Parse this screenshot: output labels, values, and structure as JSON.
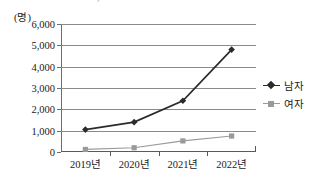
{
  "top_cutoff_text": "— ——  ——  ——  ,  ——",
  "chart_data": {
    "type": "line",
    "title": "",
    "xlabel": "",
    "ylabel": "(명)",
    "categories": [
      "2019년",
      "2020년",
      "2021년",
      "2022년"
    ],
    "series": [
      {
        "name": "남자",
        "values": [
          1050,
          1400,
          2400,
          4800
        ],
        "color": "#2b2b2b",
        "marker": "diamond"
      },
      {
        "name": "여자",
        "values": [
          120,
          200,
          520,
          750
        ],
        "color": "#9a9a9a",
        "marker": "square"
      }
    ],
    "ylim": [
      0,
      6000
    ],
    "ytick_values": [
      0,
      1000,
      2000,
      3000,
      4000,
      5000,
      6000
    ],
    "ytick_labels": [
      "0",
      "1,000",
      "2,000",
      "3,000",
      "4,000",
      "5,000",
      "6,000"
    ],
    "grid": true,
    "legend_position": "right",
    "legend_entries": [
      "남자",
      "여자"
    ]
  },
  "colors": {
    "male_line": "#2b2b2b",
    "female_line": "#9a9a9a",
    "gridline": "#8a8a8a",
    "axis": "#5a5a5a",
    "text": "#1a1a1a",
    "background": "#ffffff"
  }
}
